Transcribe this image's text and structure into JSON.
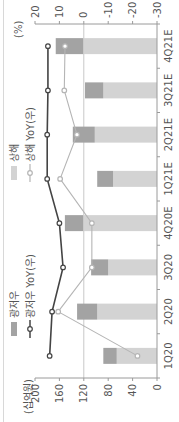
{
  "chart_data": {
    "type": "bar",
    "stacked": true,
    "orientation_note": "rendered rotated 90 degrees counter-clockwise",
    "title": "",
    "categories": [
      "1Q20",
      "2Q20",
      "3Q20",
      "4Q20E",
      "1Q21E",
      "2Q21E",
      "3Q21E",
      "4Q21E"
    ],
    "series": [
      {
        "name": "광저우",
        "kind": "bar",
        "axis": "left",
        "color": "#a3a3a3",
        "values": [
          22,
          33,
          28,
          30,
          26,
          36,
          30,
          45
        ]
      },
      {
        "name": "상해",
        "kind": "bar",
        "axis": "left",
        "color": "#d3d3d3",
        "values": [
          66,
          98,
          80,
          121,
          72,
          102,
          88,
          121
        ]
      },
      {
        "name": "광저우 YoY(우)",
        "kind": "line",
        "axis": "right",
        "color": "#444444",
        "values": [
          14,
          13,
          8.5,
          10,
          15,
          15,
          14.7,
          14.7
        ]
      },
      {
        "name": "상해 YoY(우)",
        "kind": "line",
        "axis": "right",
        "color": "#b5b5b5",
        "values": [
          -22,
          10.5,
          -3.3,
          -3.3,
          9.7,
          2.8,
          8,
          7.7
        ]
      }
    ],
    "ylabel": "(십억원)",
    "ylabel_right": "(%)",
    "ylim": [
      0,
      200
    ],
    "yticks": [
      0,
      40,
      80,
      120,
      160,
      200
    ],
    "ylim_right": [
      -30,
      20
    ],
    "yticks_right": [
      -30,
      -20,
      -10,
      0,
      10,
      20
    ],
    "reference_line": {
      "axis": "right",
      "value": 0
    },
    "legend": [
      "광저우",
      "광저우 YoY(우)",
      "상해",
      "상해 YoY(우)"
    ],
    "legend_position": "top"
  },
  "labels": {
    "left_unit": "(십억원)",
    "right_unit": "(%)",
    "left_ticks": [
      "200",
      "160",
      "120",
      "80",
      "40",
      "0"
    ],
    "right_ticks": [
      "20",
      "10",
      "0",
      "-10",
      "-20",
      "-30"
    ],
    "legend": {
      "guangzhou": "광저우",
      "guangzhou_yoy": "광저우 YoY(우)",
      "shanghai": "상해",
      "shanghai_yoy": "상해 YoY(우)"
    }
  }
}
